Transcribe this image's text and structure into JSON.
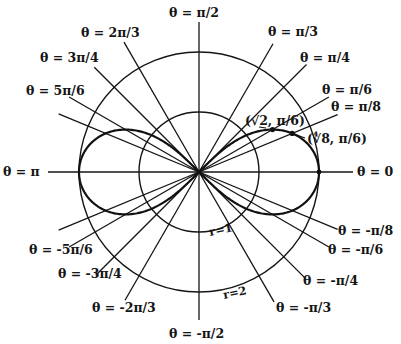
{
  "diagram": {
    "type": "polar-plot",
    "center": [
      199,
      172
    ],
    "unit_px": 60,
    "colors": {
      "ink": "#151515",
      "background": "#ffffff"
    },
    "circles": [
      {
        "r": 1,
        "label": "r=1",
        "label_pos": [
          210,
          236
        ]
      },
      {
        "r": 2,
        "label": "r=2",
        "label_pos": [
          224,
          299
        ]
      }
    ],
    "curve": {
      "equation": "r^2 = 4cos(2θ)",
      "description": "lemniscate"
    },
    "points": [
      {
        "label": "(√2, π/6)",
        "r": 1.4142,
        "theta_deg": 30,
        "label_pos": [
          245,
          125
        ],
        "arrow_to": [
          266,
          128
        ]
      },
      {
        "label": "(∜8, π/6)",
        "r": 1.6818,
        "theta_deg": 22.5,
        "label_pos": [
          307,
          143
        ],
        "arrow_to": [
          294,
          134
        ]
      }
    ],
    "rays": [
      {
        "label": "θ = π/2",
        "deg": 90,
        "len": 150,
        "label_pos": [
          169,
          17
        ]
      },
      {
        "label": "θ = π/3",
        "deg": 60,
        "len": 148,
        "label_pos": [
          268,
          36
        ]
      },
      {
        "label": "θ = π/4",
        "deg": 45,
        "len": 152,
        "label_pos": [
          300,
          62
        ]
      },
      {
        "label": "θ = π/6",
        "deg": 30,
        "len": 150,
        "label_pos": [
          322,
          94
        ]
      },
      {
        "label": "θ = π/8",
        "deg": 22.5,
        "len": 150,
        "label_pos": [
          331,
          111
        ]
      },
      {
        "label": "θ = 0",
        "deg": 0,
        "len": 154,
        "label_pos": [
          357,
          176
        ]
      },
      {
        "label": "θ = 2π/3",
        "deg": 120,
        "len": 150,
        "label_pos": [
          81,
          37
        ]
      },
      {
        "label": "θ = 3π/4",
        "deg": 135,
        "len": 148,
        "label_pos": [
          40,
          62
        ]
      },
      {
        "label": "θ = 5π/6",
        "deg": 150,
        "len": 150,
        "label_pos": [
          26,
          95
        ]
      },
      {
        "label": "",
        "deg": 157.5,
        "len": 152,
        "label_pos": null
      },
      {
        "label": "θ = π",
        "deg": 180,
        "len": 151,
        "label_pos": [
          3,
          176
        ]
      },
      {
        "label": "",
        "deg": -157.5,
        "len": 152,
        "label_pos": null
      },
      {
        "label": "θ = -5π/6",
        "deg": -150,
        "len": 150,
        "label_pos": [
          29,
          254
        ]
      },
      {
        "label": "θ = -3π/4",
        "deg": -135,
        "len": 146,
        "label_pos": [
          58,
          278
        ]
      },
      {
        "label": "θ = -2π/3",
        "deg": -120,
        "len": 148,
        "label_pos": [
          92,
          312
        ]
      },
      {
        "label": "θ = -π/2",
        "deg": -90,
        "len": 148,
        "label_pos": [
          169,
          338
        ]
      },
      {
        "label": "θ = -π/3",
        "deg": -60,
        "len": 150,
        "label_pos": [
          276,
          312
        ]
      },
      {
        "label": "θ = -π/4",
        "deg": -45,
        "len": 150,
        "label_pos": [
          303,
          285
        ]
      },
      {
        "label": "θ = -π/6",
        "deg": -30,
        "len": 150,
        "label_pos": [
          328,
          254
        ]
      },
      {
        "label": "θ = -π/8",
        "deg": -22.5,
        "len": 150,
        "label_pos": [
          338,
          235
        ]
      }
    ]
  }
}
